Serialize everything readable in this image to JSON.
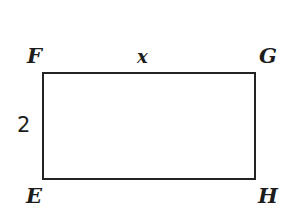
{
  "figure": {
    "type": "rectangle-diagram",
    "shape_name": "rectangle",
    "background_color": "#ffffff",
    "stroke_color": "#232323",
    "stroke_width_px": 2,
    "text_color": "#1d1d1d",
    "vertices": [
      {
        "id": "F",
        "label": "F",
        "position": "top-left"
      },
      {
        "id": "G",
        "label": "G",
        "position": "top-right"
      },
      {
        "id": "E",
        "label": "E",
        "position": "bottom-left"
      },
      {
        "id": "H",
        "label": "H",
        "position": "bottom-right"
      }
    ],
    "side_labels": [
      {
        "id": "top",
        "label": "x",
        "edge": "FG",
        "placement": "above-top-edge"
      },
      {
        "id": "left",
        "label": "2",
        "edge": "EF",
        "placement": "left-of-left-edge"
      }
    ]
  },
  "chart_data": {
    "type": "diagram",
    "title": "",
    "shape": "rectangle",
    "vertex_labels": [
      "F",
      "G",
      "H",
      "E"
    ],
    "labeled_sides": [
      {
        "side": "FG",
        "value": "x"
      },
      {
        "side": "EF",
        "value": "2"
      }
    ],
    "unlabeled_sides": [
      "GH",
      "EH"
    ],
    "geometry_px": {
      "left": 42,
      "top": 72,
      "width": 214,
      "height": 108
    }
  }
}
